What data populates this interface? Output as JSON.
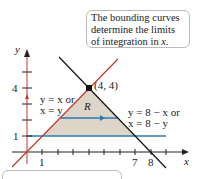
{
  "callout": {
    "line1": "The bounding curves",
    "line2": "determine the limits",
    "line3": "of integration in ",
    "var": "x."
  },
  "labels": {
    "y_axis": "y",
    "x_axis": "x",
    "point": "(4, 4)",
    "region": "R",
    "left_curve_line1": "y = x or",
    "left_curve_line2": "x = y",
    "right_curve_line1": "y = 8 − x or",
    "right_curve_line2": "x = 8 − y",
    "tick_y4": "4",
    "tick_y1": "1",
    "tick_x1": "1",
    "tick_x7": "7",
    "tick_x8": "8"
  },
  "colors": {
    "region_fill": "#ddd6c8",
    "line_y_eq_x": "#c0392b",
    "line_y_eq_8_minus_x": "#111111",
    "horizontal_lines": "#2a7ab8",
    "axes": "#222222"
  }
}
